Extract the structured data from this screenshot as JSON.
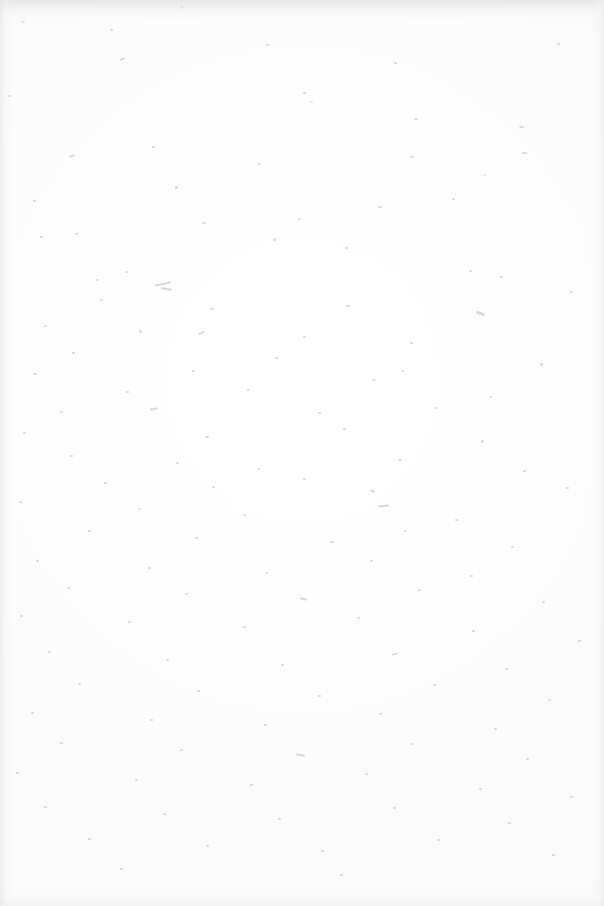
{
  "document": {
    "kind": "scanned-page",
    "page_state": "blank",
    "visible_text": "",
    "width_px": 604,
    "height_px": 906,
    "background_color": "#fdfdfd",
    "paper_tone": "#ffffff",
    "edge_shadow_color": "#e1e2e4",
    "speck_color": "#b9babd",
    "notes": "No printed text, headings, figures, page numbers or UI controls are rendered on this page."
  },
  "content": {
    "body_text": ""
  }
}
